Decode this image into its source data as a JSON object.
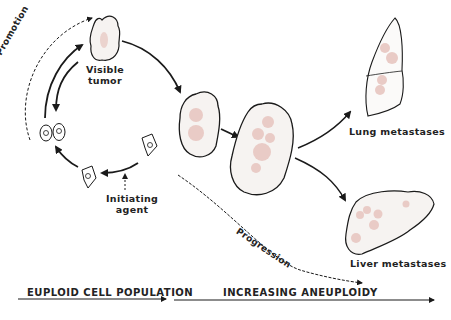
{
  "diagram": {
    "colors": {
      "background": "#ffffff",
      "ink": "#1a1a1a",
      "tumor_fill": "#f6f3f1",
      "nodule_pink": "#e9cbc6"
    },
    "labels": {
      "visible_tumor_line1": "Visible",
      "visible_tumor_line2": "tumor",
      "promotion": "Promotion",
      "initiating_agent_line1": "Initiating",
      "initiating_agent_line2": "agent",
      "progression": "Progression",
      "lung_metastases": "Lung metastases",
      "liver_metastases": "Liver metastases"
    },
    "axis": {
      "left_label": "EUPLOID CELL POPULATION",
      "right_label": "INCREASING ANEUPLOIDY"
    },
    "nodes": [
      {
        "id": "normal-cell",
        "label": "Normal cell"
      },
      {
        "id": "initiated-cell",
        "label": "Initiated cell"
      },
      {
        "id": "dividing-cells",
        "label": "Dividing cells"
      },
      {
        "id": "visible-tumor",
        "label": "Visible tumor"
      },
      {
        "id": "tumor-stage-1",
        "label": "Growing tumor"
      },
      {
        "id": "tumor-stage-2",
        "label": "Aneuploid tumor"
      },
      {
        "id": "lung",
        "label": "Lung metastases"
      },
      {
        "id": "liver",
        "label": "Liver metastases"
      }
    ]
  }
}
